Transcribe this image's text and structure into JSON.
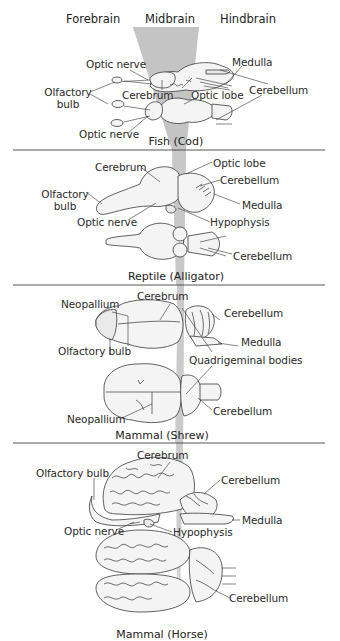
{
  "header": {
    "columns": [
      "Forebrain",
      "Midbrain",
      "Hindbrain"
    ]
  },
  "colors": {
    "wedge": "#c8c8c8",
    "divider": "#444444",
    "text": "#2b2b2b",
    "brain_fill": "#f4f4f4"
  },
  "panels": [
    {
      "caption": "Fish (Cod)",
      "labels": {
        "optic_nerve_top": "Optic nerve",
        "olfactory_bulb": "Olfactory\nbulb",
        "olfactory_line1": "Olfactory",
        "olfactory_line2": "bulb",
        "cerebrum": "Cerebrum",
        "optic_lobe": "Optic lobe",
        "medulla": "Medulla",
        "cerebellum": "Cerebellum",
        "optic_nerve_bottom": "Optic nerve"
      }
    },
    {
      "caption": "Reptile (Alligator)",
      "labels": {
        "cerebrum": "Cerebrum",
        "optic_lobe": "Optic lobe",
        "cerebellum_top": "Cerebellum",
        "olfactory_line1": "Olfactory",
        "olfactory_line2": "bulb",
        "medulla": "Medulla",
        "optic_nerve": "Optic nerve",
        "hypophysis": "Hypophysis",
        "cerebellum_bottom": "Cerebellum"
      }
    },
    {
      "caption": "Mammal (Shrew)",
      "labels": {
        "neopallium_top": "Neopallium",
        "cerebrum": "Cerebrum",
        "cerebellum_top": "Cerebellum",
        "medulla": "Medulla",
        "olfactory_bulb": "Olfactory bulb",
        "quadrigeminal": "Quadrigeminal bodies",
        "neopallium_bottom": "Neopallium",
        "cerebellum_bottom": "Cerebellum"
      }
    },
    {
      "caption": "Mammal (Horse)",
      "labels": {
        "cerebrum": "Cerebrum",
        "olfactory_bulb": "Olfactory bulb",
        "cerebellum_top": "Cerebellum",
        "medulla": "Medulla",
        "optic_nerve": "Optic nerve",
        "hypophysis": "Hypophysis",
        "cerebellum_bottom": "Cerebellum"
      }
    }
  ]
}
